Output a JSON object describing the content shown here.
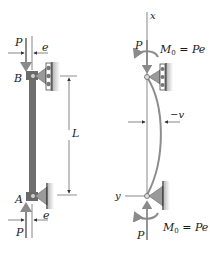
{
  "left_figure": {
    "labels": {
      "P_top": "P",
      "e_top": "e",
      "B": "B",
      "L": "L",
      "A": "A",
      "P_bottom": "P",
      "e_bottom": "e"
    }
  },
  "right_figure": {
    "labels": {
      "x_axis": "x",
      "y_axis": "y",
      "P_top": "P",
      "P_bottom": "P",
      "moment_top": "M",
      "moment_top_sub": "0",
      "moment_top_eq": " = Pe",
      "moment_bottom": "M",
      "moment_bottom_sub": "0",
      "moment_bottom_eq": " = Pe",
      "deflection": "−v"
    }
  },
  "colors": {
    "column": "#6e6e6e",
    "arrow": "#8a8a8a",
    "support": "#9a9a9a",
    "line": "#333333",
    "curve": "#8c8c8c"
  }
}
